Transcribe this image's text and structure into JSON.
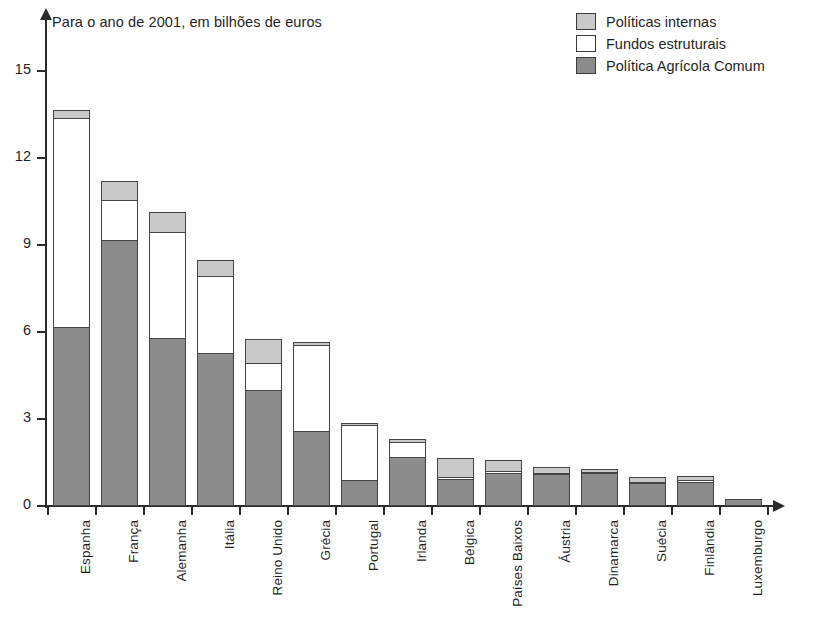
{
  "subtitle": "Para o ano de 2001, em bilhões de euros",
  "legend": {
    "items": [
      {
        "label": "Políticas internas",
        "color": "#c9c9c9",
        "key": "politicas_internas"
      },
      {
        "label": "Fundos estruturais",
        "color": "#ffffff",
        "key": "fundos_estruturais"
      },
      {
        "label": "Política Agrícola Comum",
        "color": "#8c8c8c",
        "key": "politica_agricola_comum"
      }
    ]
  },
  "axis": {
    "y_ticks": [
      "0",
      "3",
      "6",
      "9",
      "12",
      "15"
    ],
    "y_tick_values": [
      0,
      3,
      6,
      9,
      12,
      15
    ]
  },
  "chart_data": {
    "type": "bar",
    "stacked": true,
    "title": "",
    "subtitle": "Para o ano de 2001, em bilhões de euros",
    "xlabel": "",
    "ylabel": "",
    "ylim": [
      0,
      16.8
    ],
    "grid": false,
    "legend_position": "top-right",
    "categories": [
      "Espanha",
      "França",
      "Alemanha",
      "Itália",
      "Reino Unido",
      "Grécia",
      "Portugal",
      "Irlanda",
      "Bélgica",
      "Países Baixos",
      "Áustria",
      "Dinamarca",
      "Suécia",
      "Finlândia",
      "Luxemburgo"
    ],
    "series": [
      {
        "name": "Política Agrícola Comum",
        "color": "#8c8c8c",
        "values": [
          6.2,
          9.2,
          5.8,
          5.3,
          4.0,
          2.6,
          0.9,
          1.7,
          0.95,
          1.15,
          1.1,
          1.15,
          0.8,
          0.85,
          0.25
        ]
      },
      {
        "name": "Fundos estruturais",
        "color": "#ffffff",
        "values": [
          7.25,
          1.4,
          3.7,
          2.7,
          1.0,
          3.0,
          1.95,
          0.55,
          0.1,
          0.1,
          0.1,
          0.05,
          0.1,
          0.1,
          0.0
        ]
      },
      {
        "name": "Políticas internas",
        "color": "#c9c9c9",
        "values": [
          0.3,
          0.7,
          0.75,
          0.6,
          0.85,
          0.15,
          0.1,
          0.15,
          0.7,
          0.45,
          0.25,
          0.15,
          0.2,
          0.2,
          0.0
        ]
      }
    ],
    "totals": [
      13.75,
      11.3,
      10.25,
      8.6,
      5.85,
      5.75,
      2.95,
      2.4,
      1.75,
      1.7,
      1.45,
      1.35,
      1.1,
      1.15,
      0.25
    ]
  }
}
